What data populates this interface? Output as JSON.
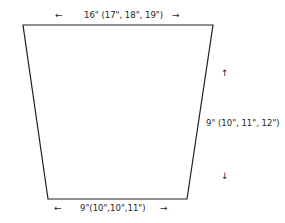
{
  "diagram": {
    "type": "sewing-pattern-piece",
    "shape": "trapezoid",
    "stroke_color": "#231f20",
    "vertices": {
      "top_left": [
        23,
        25
      ],
      "top_right": [
        213,
        25
      ],
      "bottom_right": [
        187,
        199
      ],
      "bottom_left": [
        48,
        199
      ]
    },
    "dimensions": {
      "top_width": "16\" (17\", 18\", 19\")",
      "height": "9\" (10\", 11\", 12\")",
      "bottom_width": "9\"(10\",10\",11\")"
    },
    "arrows": {
      "left": "←",
      "right": "→",
      "up": "↑",
      "down": "↓"
    }
  }
}
